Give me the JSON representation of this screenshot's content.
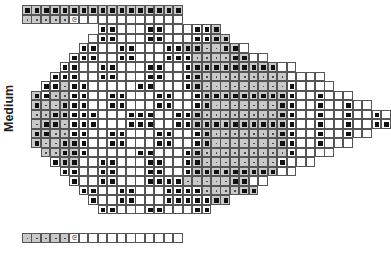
{
  "label": "Medium",
  "legend": {
    "B": "gray cell with solid block",
    "D": "gray cell with dot",
    "S": "white cell with solid block",
    "E": "open mesh (white)",
    "C": "chain symbol"
  },
  "chain_symbol": "ch",
  "colors": {
    "gray": "#c9c9c9",
    "block": "#111111",
    "grid_line": "#555555"
  },
  "grid": {
    "origin_x": 22,
    "origin_y": 5,
    "cell_w": 9.45,
    "cell_h": 9.5,
    "rows": [
      {
        "start": 0,
        "cells": "BBBBBBBBBBBBBBBBB"
      },
      {
        "start": 0,
        "cells": "DDDDDCEEEEEEEEEEE"
      },
      {
        "start": 8,
        "cells": "SSEEESSEEESSB"
      },
      {
        "start": 7,
        "cells": "ESSEEESSEEESSBB"
      },
      {
        "start": 6,
        "cells": "SSEESSEEESSBBDDBBE"
      },
      {
        "start": 5,
        "cells": "SSSEESSEEESSSDDDDBBEE"
      },
      {
        "start": 4,
        "cells": "SSEESSEEESSEESBBBBBBBBBEE"
      },
      {
        "start": 3,
        "cells": "SSSEESSEEESSEESBDDDDDDDDDEEEE"
      },
      {
        "start": 2,
        "cells": "SSDSSEEEEESSEEESBDDDDDDDDDSEEEE"
      },
      {
        "start": 1,
        "cells": "BSDDSSEESSEEESSEESBBBBBBBBBSEESEEE"
      },
      {
        "start": 1,
        "cells": "BDDBSSEESSEEESSEESBDDDDDDDBSEESEESEE"
      },
      {
        "start": 1,
        "cells": "DDBBSSSEEESSSEESSBDDDDDDDDBSEESEESEESE"
      },
      {
        "start": 1,
        "cells": "DBBDSSSEEESSSEESSBBBBBBBBBBSEESEESEESS"
      },
      {
        "start": 1,
        "cells": "BBDDSSEESSEEESSEESBDDDDDDDBSEESEESEE"
      },
      {
        "start": 1,
        "cells": "BDDBBSEESSEEESSEESBDDDDDDDBSEESEEE"
      },
      {
        "start": 2,
        "cells": "DDBBSEEEEESSEEESBDDDDDDDDDSEEEE"
      },
      {
        "start": 3,
        "cells": "SBBEESSEEESSEESBDDDDDDDDSEEE"
      },
      {
        "start": 4,
        "cells": "SSEESSEEESSEESBBBBBBBBBEE"
      },
      {
        "start": 5,
        "cells": "SEESSEEESSSSDDDDDBBEE"
      },
      {
        "start": 6,
        "cells": "SSEESSEEESSSSDDDDBB"
      },
      {
        "start": 7,
        "cells": "SEESSEEESSSSSBB"
      },
      {
        "start": 8,
        "cells": "SSEEESSEEESS"
      },
      {
        "start": 8,
        "cells": ""
      },
      {
        "start": 0,
        "cells": "DDDDDCEEEEEEEEEEE"
      }
    ]
  }
}
